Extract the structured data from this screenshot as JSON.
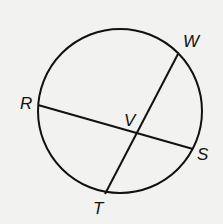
{
  "figure": {
    "background": "#f2f2f0",
    "stroke": "#111111",
    "circle": {
      "cx": 120,
      "cy": 111,
      "r": 82
    },
    "chords": [
      {
        "name": "RS",
        "from": "R",
        "to": "S"
      },
      {
        "name": "WT",
        "from": "W",
        "to": "T"
      }
    ],
    "points": {
      "R": {
        "x": 38,
        "y": 105
      },
      "S": {
        "x": 193,
        "y": 149
      },
      "W": {
        "x": 178,
        "y": 54
      },
      "T": {
        "x": 105,
        "y": 194
      },
      "V": {
        "x": 137,
        "y": 132
      }
    },
    "labels": {
      "W": "W",
      "R": "R",
      "V": "V",
      "S": "S",
      "T": "T"
    }
  }
}
